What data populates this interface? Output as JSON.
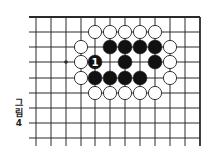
{
  "diagram": {
    "type": "go-board-fragment",
    "caption": {
      "chars": [
        "그",
        "림",
        "4"
      ],
      "text": "그림 4"
    },
    "grid": {
      "columns_x": [
        36,
        51,
        66,
        81,
        95,
        110,
        125,
        140,
        155,
        170,
        185,
        200
      ],
      "rows_y": [
        17,
        32,
        47,
        62,
        78,
        93,
        108,
        123,
        138
      ],
      "line_left": 29,
      "line_bottom": 146,
      "top_edge": true,
      "right_edge": true,
      "line_color": "#2a2a2a"
    },
    "star_points": [
      {
        "col": 2,
        "row": 3
      }
    ],
    "stone_radius": 7,
    "stones": [
      {
        "color": "white",
        "col": 4,
        "row": 1
      },
      {
        "color": "white",
        "col": 5,
        "row": 1
      },
      {
        "color": "white",
        "col": 6,
        "row": 1
      },
      {
        "color": "white",
        "col": 7,
        "row": 1
      },
      {
        "color": "white",
        "col": 8,
        "row": 1
      },
      {
        "color": "white",
        "col": 3,
        "row": 2
      },
      {
        "color": "black",
        "col": 5,
        "row": 2
      },
      {
        "color": "black",
        "col": 6,
        "row": 2
      },
      {
        "color": "black",
        "col": 7,
        "row": 2
      },
      {
        "color": "black",
        "col": 8,
        "row": 2
      },
      {
        "color": "white",
        "col": 9,
        "row": 2
      },
      {
        "color": "white",
        "col": 3,
        "row": 3
      },
      {
        "color": "black",
        "col": 4,
        "row": 3,
        "label": "1"
      },
      {
        "color": "black",
        "col": 6,
        "row": 3
      },
      {
        "color": "black",
        "col": 8,
        "row": 3
      },
      {
        "color": "white",
        "col": 9,
        "row": 3
      },
      {
        "color": "white",
        "col": 3,
        "row": 4
      },
      {
        "color": "black",
        "col": 4,
        "row": 4
      },
      {
        "color": "black",
        "col": 5,
        "row": 4
      },
      {
        "color": "black",
        "col": 6,
        "row": 4
      },
      {
        "color": "black",
        "col": 7,
        "row": 4
      },
      {
        "color": "white",
        "col": 9,
        "row": 4
      },
      {
        "color": "white",
        "col": 4,
        "row": 5
      },
      {
        "color": "white",
        "col": 5,
        "row": 5
      },
      {
        "color": "white",
        "col": 6,
        "row": 5
      },
      {
        "color": "white",
        "col": 7,
        "row": 5
      },
      {
        "color": "white",
        "col": 8,
        "row": 5
      }
    ],
    "colors": {
      "black_stone": "#111111",
      "white_stone": "#ffffff",
      "stone_outline": "#222222",
      "label_on_black": "#ffffff"
    }
  }
}
